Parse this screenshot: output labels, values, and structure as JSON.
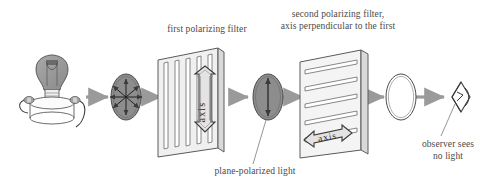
{
  "diagram": {
    "background": "#ffffff",
    "stroke": "#555555",
    "arrow_color": "#9a9a9a",
    "fill_gray": "#8d8d8d",
    "panel_gray": "#d9d9d9"
  },
  "labels": {
    "first_filter": "first polarizing filter",
    "second_filter_line1": "second polarizing filter,",
    "second_filter_line2": "axis perpendicular to the first",
    "plane_polarized": "plane-polarized light",
    "observer_line1": "observer sees",
    "observer_line2": "no light",
    "axis_first": "axis",
    "axis_second": "axis"
  },
  "elements": {
    "light_source": "light-bulb-on-stand",
    "unpolarized_beam": "unpolarized-light-ellipse",
    "polarized_beam": "plane-polarized-light-ellipse",
    "blocked_beam": "no-light-ellipse",
    "observer": "observer-eye"
  },
  "arrows": [
    {
      "name": "arrow-bulb-to-unpolarized",
      "x1": 86,
      "y1": 97,
      "x2": 110,
      "y2": 97
    },
    {
      "name": "arrow-unpolarized-to-filter1",
      "x1": 141,
      "y1": 97,
      "x2": 163,
      "y2": 97
    },
    {
      "name": "arrow-through-filter1",
      "x1": 230,
      "y1": 97,
      "x2": 250,
      "y2": 97
    },
    {
      "name": "arrow-polarized-to-filter2",
      "x1": 283,
      "y1": 97,
      "x2": 305,
      "y2": 97
    },
    {
      "name": "arrow-through-filter2",
      "x1": 366,
      "y1": 97,
      "x2": 386,
      "y2": 97
    },
    {
      "name": "arrow-to-observer",
      "x1": 416,
      "y1": 97,
      "x2": 446,
      "y2": 97
    }
  ]
}
